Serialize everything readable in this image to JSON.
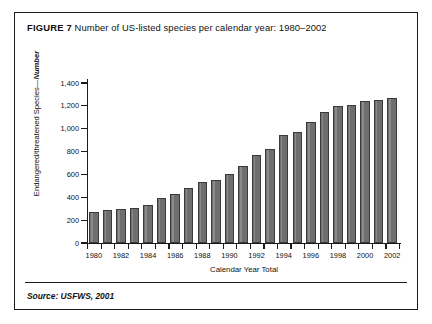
{
  "figure": {
    "label": "FIGURE 7",
    "title": "Number of US-listed species per calendar year: 1980–2002",
    "source": "Source: USFWS, 2001"
  },
  "axes": {
    "y_title_plain": "Endangered/threatened Species—",
    "y_title_bold": "Number",
    "x_title": "Calendar Year Total",
    "y_ticks": [
      "0",
      "200",
      "400",
      "600",
      "800",
      "1,000",
      "1,200",
      "1,400"
    ],
    "x_tick_labels": [
      "1980",
      "1982",
      "1984",
      "1986",
      "1988",
      "1990",
      "1992",
      "1994",
      "1996",
      "1998",
      "2000",
      "2002"
    ]
  },
  "chart_data": {
    "type": "bar",
    "title": "Number of US-listed species per calendar year: 1980–2002",
    "xlabel": "Calendar Year Total",
    "ylabel": "Endangered/threatened Species—Number",
    "ylim": [
      0,
      1400
    ],
    "ytick_step": 200,
    "grid": false,
    "legend": null,
    "bar_color": "#6e6e6e",
    "bar_edge_color": "#3a3a3a",
    "categories": [
      "1980",
      "1981",
      "1982",
      "1983",
      "1984",
      "1985",
      "1986",
      "1987",
      "1988",
      "1989",
      "1990",
      "1991",
      "1992",
      "1993",
      "1994",
      "1995",
      "1996",
      "1997",
      "1998",
      "1999",
      "2000",
      "2001",
      "2002"
    ],
    "values": [
      275,
      285,
      300,
      305,
      335,
      395,
      430,
      485,
      530,
      555,
      600,
      670,
      770,
      820,
      945,
      970,
      1060,
      1145,
      1200,
      1210,
      1245,
      1255,
      1265
    ]
  }
}
